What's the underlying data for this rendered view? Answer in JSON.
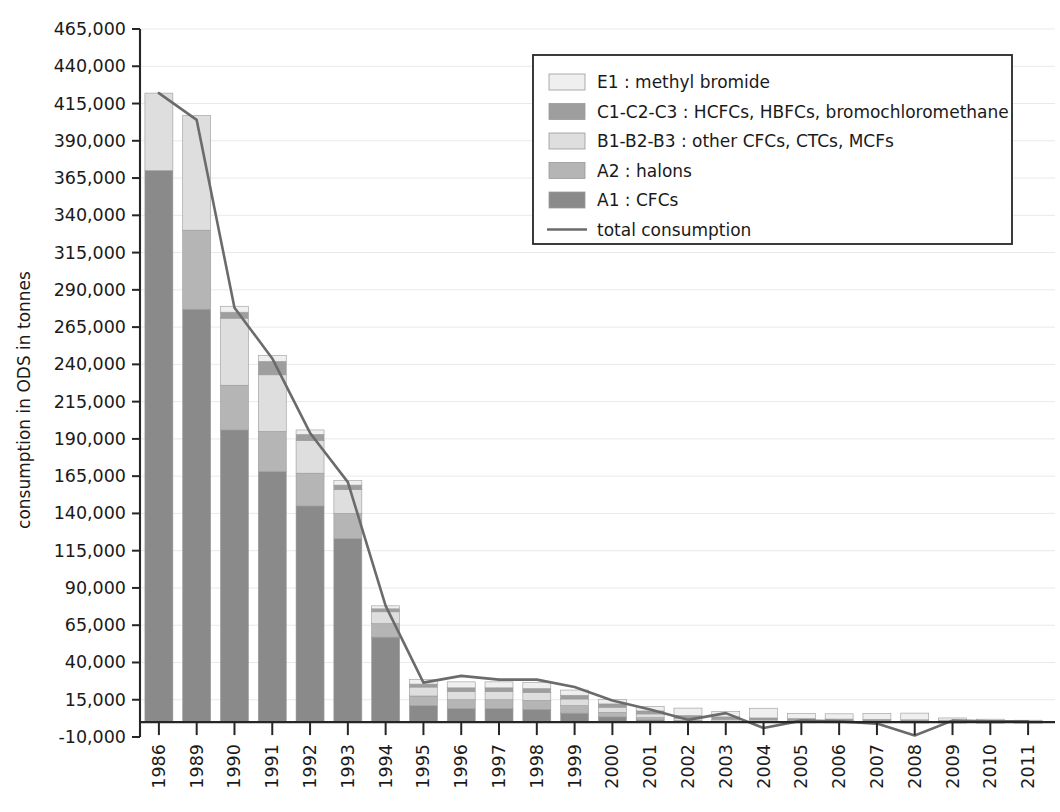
{
  "chart_data": {
    "type": "bar",
    "subtype": "stacked-bar-with-line-overlay",
    "title": "",
    "xlabel": "",
    "ylabel": "consumption in ODS in tonnes",
    "ylim": [
      -10000,
      465000
    ],
    "ytick_step": 25000,
    "grid": true,
    "legend_position": "top-right",
    "categories": [
      "1986",
      "1989",
      "1990",
      "1991",
      "1992",
      "1993",
      "1994",
      "1995",
      "1996",
      "1997",
      "1998",
      "1999",
      "2000",
      "2001",
      "2002",
      "2003",
      "2004",
      "2005",
      "2006",
      "2007",
      "2008",
      "2009",
      "2010",
      "2011"
    ],
    "ytick_labels": [
      "465,000",
      "440,000",
      "415,000",
      "390,000",
      "365,000",
      "340,000",
      "315,000",
      "290,000",
      "265,000",
      "240,000",
      "215,000",
      "190,000",
      "165,000",
      "140,000",
      "115,000",
      "90,000",
      "65,000",
      "40,000",
      "15,000",
      "-10,000"
    ],
    "ytick_values": [
      465000,
      440000,
      415000,
      390000,
      365000,
      340000,
      315000,
      290000,
      265000,
      240000,
      215000,
      190000,
      165000,
      140000,
      115000,
      90000,
      65000,
      40000,
      15000,
      -10000
    ],
    "series": [
      {
        "name": "A1 : CFCs",
        "key": "A1",
        "color": "#8a8a8a",
        "values": [
          370000,
          277000,
          196000,
          168000,
          145000,
          123000,
          57000,
          11000,
          9000,
          9000,
          8500,
          6000,
          3500,
          1500,
          500,
          300,
          200,
          150,
          100,
          80,
          50,
          30,
          20,
          10
        ]
      },
      {
        "name": "A2 : halons",
        "key": "A2",
        "color": "#b5b5b5",
        "values": [
          0,
          53000,
          30000,
          27000,
          22000,
          17000,
          9000,
          6500,
          6000,
          6000,
          6000,
          5000,
          3000,
          1500,
          600,
          400,
          300,
          200,
          150,
          120,
          80,
          50,
          30,
          20
        ]
      },
      {
        "name": "B1-B2-B3 : other CFCs, CTCs, MCFs",
        "key": "B",
        "color": "#dedede",
        "values": [
          52000,
          77000,
          45000,
          38000,
          22000,
          16000,
          8000,
          6000,
          5500,
          5500,
          5500,
          4500,
          3500,
          2500,
          1500,
          1200,
          900,
          700,
          600,
          500,
          400,
          300,
          200,
          150
        ]
      },
      {
        "name": "C1-C2-C3 : HCFCs, HBFCs, bromochloromethane",
        "key": "C",
        "color": "#9e9e9e",
        "values": [
          0,
          0,
          4000,
          9000,
          4000,
          3000,
          2000,
          2000,
          2500,
          2500,
          2500,
          2500,
          2200,
          2000,
          1800,
          1600,
          1400,
          1300,
          1200,
          1100,
          1000,
          900,
          700,
          500
        ]
      },
      {
        "name": "E1 : methyl bromide",
        "key": "E",
        "color": "#efefef",
        "values": [
          0,
          0,
          4000,
          4000,
          3000,
          3000,
          2000,
          3000,
          4000,
          4000,
          4000,
          3500,
          3000,
          3000,
          5000,
          3500,
          6500,
          3500,
          3500,
          4000,
          4500,
          1500,
          1000,
          600
        ]
      }
    ],
    "line_series": {
      "name": "total consumption",
      "color": "#6b6b6b",
      "values": [
        422000,
        404000,
        278000,
        244000,
        194000,
        161000,
        78000,
        26500,
        31000,
        28500,
        28500,
        23500,
        14500,
        8500,
        1500,
        6000,
        -4000,
        1000,
        500,
        -1000,
        -9000,
        1000,
        500,
        500
      ]
    },
    "legend": [
      {
        "label": "E1 : methyl bromide",
        "swatch": "#efefef",
        "type": "patch"
      },
      {
        "label": "C1-C2-C3 : HCFCs, HBFCs, bromochloromethane",
        "swatch": "#9e9e9e",
        "type": "patch"
      },
      {
        "label": "B1-B2-B3 : other CFCs, CTCs, MCFs",
        "swatch": "#dedede",
        "type": "patch"
      },
      {
        "label": "A2 : halons",
        "swatch": "#b5b5b5",
        "type": "patch"
      },
      {
        "label": "A1 : CFCs",
        "swatch": "#8a8a8a",
        "type": "patch"
      },
      {
        "label": "total consumption",
        "swatch": "#6b6b6b",
        "type": "line"
      }
    ]
  }
}
